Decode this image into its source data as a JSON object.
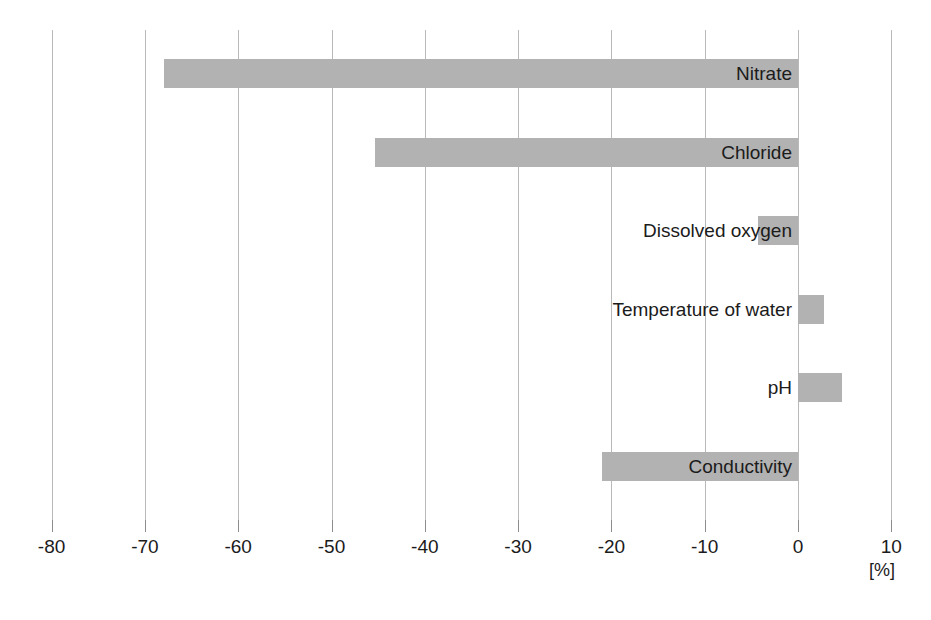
{
  "chart_data": {
    "type": "bar",
    "orientation": "horizontal",
    "title": "",
    "subtitle": "",
    "xlabel": "[%]",
    "ylabel": "",
    "xlim": [
      -85,
      12
    ],
    "axis_min": -80,
    "axis_max": 10,
    "tick_step": 10,
    "grid": true,
    "legend": false,
    "bar_color": "#b2b2b2",
    "grid_color": "#b9b9b9",
    "text_color": "#1b1b1b",
    "categories": [
      "Nitrate",
      "Chloride",
      "Dissolved oxygen",
      "Temperature of water",
      "pH",
      "Conductivity"
    ],
    "values": [
      -68,
      -45.3,
      -4.3,
      2.8,
      4.7,
      -21
    ],
    "tick_labels": [
      "-80",
      "-70",
      "-60",
      "-50",
      "-40",
      "-30",
      "-20",
      "-10",
      "0",
      "10"
    ],
    "tick_values": [
      -80,
      -70,
      -60,
      -50,
      -40,
      -30,
      -20,
      -10,
      0,
      10
    ],
    "unit": "[%]"
  },
  "axis": {
    "unit_label": "[%]"
  },
  "caption": {
    "text": ""
  }
}
